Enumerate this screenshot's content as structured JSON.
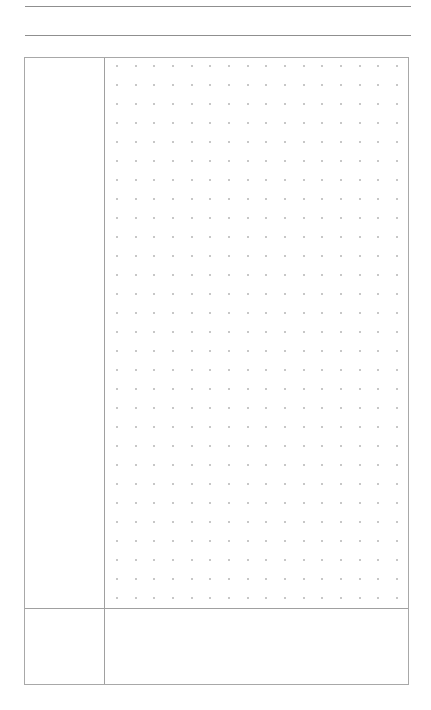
{
  "page": {
    "type": "cornell-notes-dot-grid",
    "header_lines": 2,
    "sections": {
      "cue_column": {
        "label": ""
      },
      "notes_area": {
        "label": ""
      },
      "summary_area": {
        "label": ""
      }
    },
    "dot_grid": {
      "columns": 16,
      "rows": 29,
      "spacing_x": 18.67,
      "spacing_y": 18.99,
      "origin_x": 12,
      "origin_y": 8,
      "dot_color": "#b4b4b4"
    },
    "colors": {
      "background": "#ffffff",
      "header_line": "#8f8f8f",
      "frame": "#a8a8a8",
      "divider": "#a0a0a0"
    }
  }
}
